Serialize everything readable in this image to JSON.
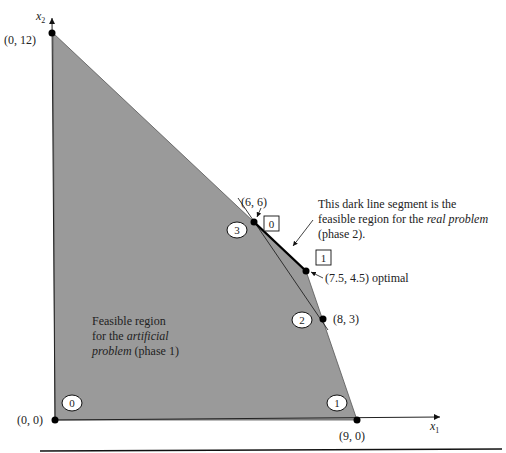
{
  "axes": {
    "x_label": "x",
    "x_sub": "1",
    "y_label": "x",
    "y_sub": "2"
  },
  "points": {
    "origin": "(0, 0)",
    "p_0_12": "(0, 12)",
    "p_9_0": "(9, 0)",
    "p_6_6": "(6, 6)",
    "p_8_3": "(8, 3)",
    "p_opt": "(7.5, 4.5) optimal"
  },
  "circled_iterations": [
    "0",
    "1",
    "2",
    "3"
  ],
  "boxed_iterations": [
    "0",
    "1"
  ],
  "annotations": {
    "real_line1": "This dark line segment is the",
    "real_line2a": "feasible region for the ",
    "real_line2b": "real problem",
    "real_line3": "(phase 2).",
    "art_line1": "Feasible region",
    "art_line2a": "for the ",
    "art_line2b": "artificial",
    "art_line3a": "problem",
    "art_line3b": " (phase 1)"
  },
  "colors": {
    "region_fill": "#9a9a9a",
    "ink": "#111111"
  }
}
